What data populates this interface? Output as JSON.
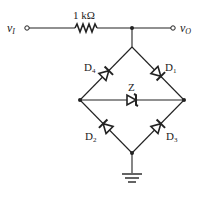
{
  "circuit": {
    "input_label": "v",
    "input_sub": "I",
    "output_label": "v",
    "output_sub": "O",
    "resistor_label": "1 kΩ",
    "diodes": [
      {
        "name": "D",
        "sub": "4"
      },
      {
        "name": "D",
        "sub": "1"
      },
      {
        "name": "D",
        "sub": "2"
      },
      {
        "name": "D",
        "sub": "3"
      }
    ],
    "zener_label": "Z"
  },
  "colors": {
    "wire": "#222222",
    "background": "#ffffff"
  }
}
